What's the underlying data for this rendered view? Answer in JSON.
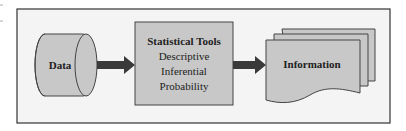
{
  "diagram": {
    "nodes": [
      {
        "id": "data",
        "shape": "cylinder",
        "label": "Data"
      },
      {
        "id": "tools",
        "shape": "rectangle",
        "title": "Statistical Tools",
        "items": [
          "Descriptive",
          "Inferential",
          "Probability"
        ]
      },
      {
        "id": "info",
        "shape": "stacked-documents",
        "label": "Information"
      }
    ],
    "edges": [
      {
        "from": "data",
        "to": "tools",
        "style": "thick-arrow"
      },
      {
        "from": "tools",
        "to": "info",
        "style": "thick-arrow"
      }
    ],
    "colors": {
      "frame_fill": "#f4f4f4",
      "frame_stroke": "#333333",
      "shape_fill": "#c8c8c8",
      "shape_stroke": "#444444",
      "arrow_fill": "#3a3a3a"
    }
  }
}
